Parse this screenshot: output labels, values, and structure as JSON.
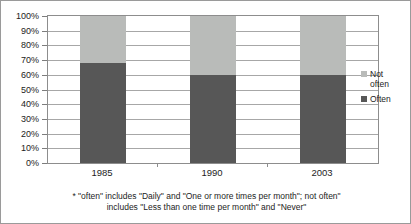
{
  "chart_data": {
    "type": "bar",
    "subtype": "stacked-100-percent",
    "title": "",
    "subtitle": "",
    "xlabel": "",
    "ylabel": "",
    "categories": [
      "1985",
      "1990",
      "2003"
    ],
    "series": [
      {
        "name": "Often",
        "values": [
          68,
          60,
          60
        ],
        "color": "#575757"
      },
      {
        "name": "Not often",
        "values": [
          32,
          40,
          40
        ],
        "color": "#b9bbb9"
      }
    ],
    "ylim": [
      0,
      100
    ],
    "ytick_values": [
      0,
      10,
      20,
      30,
      40,
      50,
      60,
      70,
      80,
      90,
      100
    ],
    "ytick_labels": [
      "0%",
      "10%",
      "20%",
      "30%",
      "40%",
      "50%",
      "60%",
      "70%",
      "80%",
      "90%",
      "100%"
    ],
    "grid": true,
    "legend_position": "right",
    "annotations": [
      "* \"often\" includes \"Daily\" and \"One or more times per month\"; not often\"",
      "includes  \"Less than one time per month\" and \"Never\""
    ]
  },
  "legend": {
    "entries": [
      {
        "label_line1": "Not",
        "label_line2": "often",
        "color": "#b9bbb9"
      },
      {
        "label_line1": "Often",
        "label_line2": "",
        "color": "#575757"
      }
    ]
  },
  "footnote": {
    "line1": "* \"often\" includes \"Daily\" and \"One or more times per month\"; not often\"",
    "line2": "includes  \"Less than one time per month\" and \"Never\""
  }
}
